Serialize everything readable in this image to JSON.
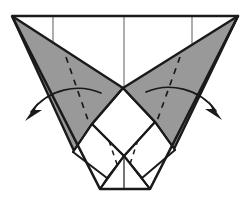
{
  "figure": {
    "type": "origami-folding-instruction",
    "canvas": {
      "width": 246,
      "height": 209
    },
    "colors": {
      "background": "#ffffff",
      "shaded_fill": "#999999",
      "unshaded_fill": "#ffffff",
      "outline": "#1a1a1a",
      "crease_line": "#4d4d4d",
      "dashed_line": "#1a1a1a",
      "arrow": "#1a1a1a"
    },
    "stroke_widths": {
      "outline": 2.6,
      "interior": 2.0,
      "thin_crease": 1.1,
      "dashed": 1.6,
      "arrow": 1.6
    },
    "geometry": {
      "top_edge": {
        "left_x": 12,
        "right_x": 238,
        "y": 16
      },
      "bottom_edge": {
        "left_x": 100,
        "right_x": 150,
        "y": 189
      },
      "center_x": 124,
      "v_junction": {
        "x": 123,
        "y": 88
      },
      "left_inner_point": {
        "x": 92,
        "y": 124
      },
      "right_inner_point": {
        "x": 155,
        "y": 122
      },
      "vertical_creases_x": [
        53,
        124,
        192
      ],
      "vertical_crease_top_y": 16
    },
    "shaded_panels": [
      {
        "name": "left-wing",
        "points": "12,16 123,88 92,124 74,151"
      },
      {
        "name": "right-wing",
        "points": "238,16 123,88 155,122 174,149"
      }
    ],
    "dashed_creases": [
      {
        "name": "left-wing-valley-crease",
        "from": [
          66,
          57
        ],
        "to": [
          89,
          123
        ]
      },
      {
        "name": "right-wing-valley-crease",
        "from": [
          180,
          57
        ],
        "to": [
          157,
          121
        ]
      },
      {
        "name": "lower-left-small-crease",
        "from": [
          108,
          143
        ],
        "to": [
          117,
          166
        ]
      },
      {
        "name": "lower-right-small-crease",
        "from": [
          139,
          142
        ],
        "to": [
          130,
          166
        ]
      }
    ],
    "arrows": [
      {
        "name": "left-fold-arrow",
        "direction": "outward-left",
        "start": [
          100,
          93
        ],
        "control": [
          55,
          88
        ],
        "end": [
          27,
          117
        ],
        "head_angle_deg": 141
      },
      {
        "name": "right-fold-arrow",
        "direction": "outward-right",
        "start": [
          146,
          92
        ],
        "control": [
          193,
          88
        ],
        "end": [
          221,
          117
        ],
        "head_angle_deg": 39
      }
    ]
  }
}
